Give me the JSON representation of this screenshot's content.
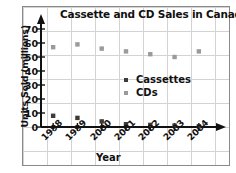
{
  "chart_data": {
    "type": "scatter",
    "title": "Cassette and CD Sales in Canada",
    "xlabel": "Year",
    "ylabel": "Units Sold (millions)",
    "categories": [
      "1998",
      "1999",
      "2000",
      "2001",
      "2002",
      "2003",
      "2004"
    ],
    "x": [
      1998,
      1999,
      2000,
      2001,
      2002,
      2003,
      2004
    ],
    "ylim": [
      0,
      75
    ],
    "xlim": [
      1997.5,
      2004.5
    ],
    "yticks": [
      0,
      10,
      20,
      30,
      40,
      50,
      60,
      70
    ],
    "grid": true,
    "legend_position": "center",
    "series": [
      {
        "name": "Cassettes",
        "color": "#3b3b3b",
        "marker": "square-dot",
        "values": [
          8,
          6.5,
          4,
          2,
          1.5,
          1,
          0.5
        ]
      },
      {
        "name": "CDs",
        "color": "#9a9a9a",
        "marker": "square-dot",
        "values": [
          57,
          59,
          56,
          54,
          52,
          50,
          54
        ]
      }
    ]
  },
  "legend": {
    "items": [
      {
        "label": "Cassettes",
        "color": "#3b3b3b"
      },
      {
        "label": "CDs",
        "color": "#9a9a9a"
      }
    ]
  },
  "colors": {
    "cassettes": "#3b3b3b",
    "cds": "#9a9a9a",
    "axis": "#111111",
    "grid": "#d3d3d3",
    "frame": "#8a8a8a",
    "background": "#ffffff"
  }
}
